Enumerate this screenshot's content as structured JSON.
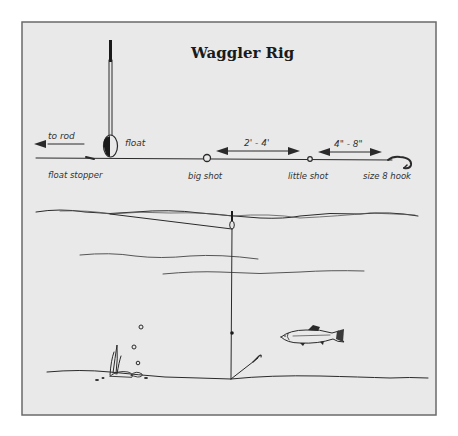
{
  "diagram": {
    "title": "Waggler Rig",
    "colors": {
      "background": "#e9e9e9",
      "frame": "#6a6a6a",
      "ink": "#2a2a2a"
    },
    "rig_labels": {
      "to_rod": "to rod",
      "float": "float",
      "float_stopper": "float stopper",
      "big_shot": "big shot",
      "little_shot": "little shot",
      "hook": "size 8 hook"
    },
    "distances": {
      "float_shot_to_little_shot": "2' - 4'",
      "little_shot_to_hook": "4\" - 8\""
    },
    "scene_elements": [
      "water-surface",
      "float",
      "line",
      "shot",
      "hook",
      "fish",
      "weed",
      "bubbles",
      "lake-bed"
    ]
  }
}
